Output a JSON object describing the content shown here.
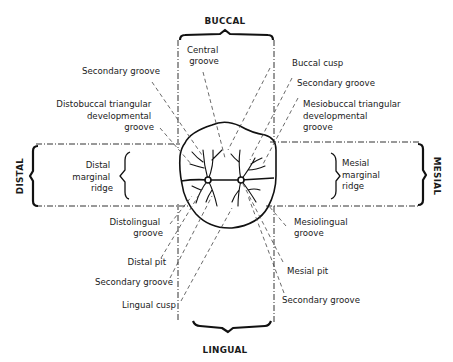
{
  "diagram": {
    "directions": {
      "buccal": "BUCCAL",
      "lingual": "LINGUAL",
      "distal": "DISTAL",
      "mesial": "MESIAL"
    },
    "labels": {
      "central_groove": [
        "Central",
        "groove"
      ],
      "secondary_groove_top_left": [
        "Secondary groove"
      ],
      "distobuccal_triangular": [
        "Distobuccal triangular",
        "developmental",
        "groove"
      ],
      "distal_marginal_ridge": [
        "Distal",
        "marginal",
        "ridge"
      ],
      "distolingual_groove": [
        "Distolingual",
        "groove"
      ],
      "distal_pit": [
        "Distal pit"
      ],
      "secondary_groove_bottom_left": [
        "Secondary groove"
      ],
      "lingual_cusp": [
        "Lingual cusp"
      ],
      "buccal_cusp": [
        "Buccal cusp"
      ],
      "secondary_groove_top_right": [
        "Secondary groove"
      ],
      "mesiobuccal_triangular": [
        "Mesiobuccal triangular",
        "developmental",
        "groove"
      ],
      "mesial_marginal_ridge": [
        "Mesial",
        "marginal",
        "ridge"
      ],
      "mesiolingual_groove": [
        "Mesiolingual",
        "groove"
      ],
      "mesial_pit": [
        "Mesial pit"
      ],
      "secondary_groove_bottom_right": [
        "Secondary groove"
      ]
    },
    "colors": {
      "background": "#ffffff",
      "ink": "#1a1a1a"
    }
  }
}
